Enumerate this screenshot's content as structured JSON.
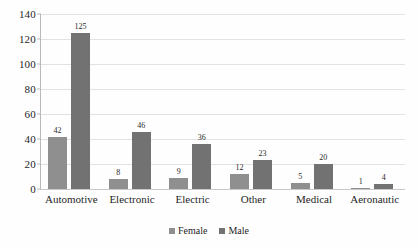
{
  "chart_data": {
    "type": "bar",
    "title": "",
    "subtitle": "",
    "xlabel": "",
    "ylabel": "",
    "ylim": [
      0,
      140
    ],
    "yticks": [
      0,
      20,
      40,
      60,
      80,
      100,
      120,
      140
    ],
    "grid": true,
    "legend_position": "bottom",
    "categories": [
      "Automotive",
      "Electronic",
      "Electric",
      "Other",
      "Medical",
      "Aeronautic"
    ],
    "series": [
      {
        "name": "Female",
        "color": "#8f8f8f",
        "values": [
          42,
          8,
          9,
          12,
          5,
          1
        ]
      },
      {
        "name": "Male",
        "color": "#727272",
        "values": [
          125,
          46,
          36,
          23,
          20,
          4
        ]
      }
    ],
    "data_labels": {
      "Automotive": {
        "Female": "42",
        "Male": "125"
      },
      "Electronic": {
        "Female": "8",
        "Male": "46"
      },
      "Electric": {
        "Female": "9",
        "Male": "36"
      },
      "Other": {
        "Female": "12",
        "Male": "23"
      },
      "Medical": {
        "Female": "5",
        "Male": "20"
      },
      "Aeronautic": {
        "Female": "1",
        "Male": "4"
      }
    },
    "annotations": []
  },
  "axes": {
    "y_tick_labels": [
      "140",
      "120",
      "100",
      "80",
      "60",
      "40",
      "20",
      "0"
    ]
  },
  "legend": {
    "items": [
      {
        "label": "Female",
        "color": "#8f8f8f"
      },
      {
        "label": "Male",
        "color": "#727272"
      }
    ]
  },
  "colors": {
    "female": "#8f8f8f",
    "male": "#727272",
    "gridline": "#e2e2e2",
    "axis": "#b9b9b9",
    "background": "#fefefe",
    "text": "#1f1f1f"
  }
}
